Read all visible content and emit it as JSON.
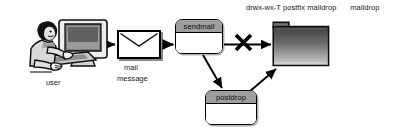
{
  "diagram": {
    "title_caption": {
      "perms": "drwx-wx-T postfix maildrop",
      "dirname": "maildrop"
    },
    "nodes": {
      "user": {
        "label": "user",
        "icon": "user-at-computer-icon"
      },
      "mail_message": {
        "label_line1": "mail",
        "label_line2": "message",
        "icon": "envelope-icon"
      },
      "sendmail": {
        "label": "sendmail"
      },
      "postdrop": {
        "label": "postdrop"
      },
      "maildrop_dir": {
        "icon": "folder-icon"
      }
    },
    "markers": {
      "blocked": {
        "name": "x-cross-blocked-marker",
        "glyph": "X"
      }
    },
    "edges": [
      {
        "from": "user",
        "to": "mail_message"
      },
      {
        "from": "mail_message",
        "to": "sendmail"
      },
      {
        "from": "sendmail",
        "to": "maildrop_dir",
        "blocked": true
      },
      {
        "from": "sendmail",
        "to": "postdrop"
      },
      {
        "from": "postdrop",
        "to": "maildrop_dir"
      }
    ],
    "colors": {
      "stroke": "#000000",
      "titlebar_gray": "#9e9e9e",
      "folder_dark": "#4a4a4a",
      "folder_light": "#c8c8c8",
      "background": "#ffffff"
    }
  }
}
